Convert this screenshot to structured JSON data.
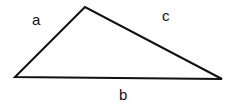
{
  "diagram": {
    "type": "triangle",
    "vertices": {
      "left": [
        15,
        77
      ],
      "top": [
        85,
        7
      ],
      "right": [
        222,
        79
      ]
    },
    "sides": [
      {
        "id": "a",
        "label": "a",
        "from": "left",
        "to": "top"
      },
      {
        "id": "b",
        "label": "b",
        "from": "left",
        "to": "right"
      },
      {
        "id": "c",
        "label": "c",
        "from": "top",
        "to": "right"
      }
    ],
    "stroke_color": "#111111",
    "background": "#ffffff"
  }
}
